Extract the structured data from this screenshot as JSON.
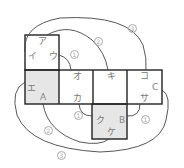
{
  "diagram": {
    "type": "cube-net",
    "colors": {
      "line": "#222222",
      "shaded": "#e6e6e6",
      "curve": "#555555",
      "text": "#777777"
    },
    "faces": [
      {
        "id": "top",
        "shaded": false
      },
      {
        "id": "left",
        "shaded": true
      },
      {
        "id": "mid1",
        "shaded": false
      },
      {
        "id": "mid2",
        "shaded": false
      },
      {
        "id": "right",
        "shaded": false
      },
      {
        "id": "bottom",
        "shaded": true
      }
    ],
    "labels": {
      "a": "ア",
      "i": "イ",
      "u": "ウ",
      "e": "エ",
      "A": "A",
      "o": "オ",
      "ka": "カ",
      "ki": "キ",
      "ko": "コ",
      "C": "C",
      "sa": "サ",
      "ku": "ク",
      "B": "B",
      "ke": "ケ"
    },
    "edge_markers": {
      "m1a": "1",
      "m1b": "1",
      "m1c": "1",
      "m2a": "2",
      "m2b": "2",
      "m3a": "3",
      "m3b": "3"
    }
  }
}
